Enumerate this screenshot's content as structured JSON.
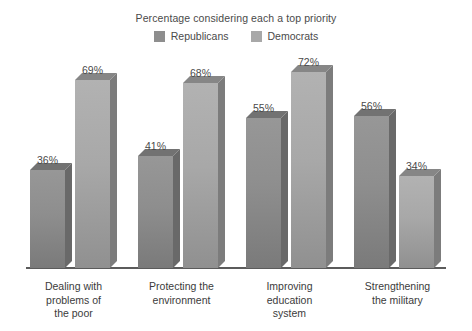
{
  "chart_data": {
    "type": "bar",
    "title": "Percentage considering each a top priority",
    "xlabel": "",
    "ylabel": "",
    "ylim": [
      0,
      100
    ],
    "grid": false,
    "legend_position": "top-center",
    "categories": [
      "Dealing with problems of the poor",
      "Protecting the environment",
      "Improving education system",
      "Strengthening the military"
    ],
    "category_lines": [
      [
        "Dealing with",
        "problems of",
        "the poor"
      ],
      [
        "Protecting the",
        "environment"
      ],
      [
        "Improving",
        "education",
        "system"
      ],
      [
        "Strengthening",
        "the military"
      ]
    ],
    "series": [
      {
        "name": "Republicans",
        "color": "#8e8e8e",
        "values": [
          36,
          41,
          55,
          56
        ],
        "labels": [
          "36%",
          "41%",
          "55%",
          "56%"
        ]
      },
      {
        "name": "Democrats",
        "color": "#a8a8a8",
        "values": [
          69,
          68,
          72,
          34
        ],
        "labels": [
          "69%",
          "68%",
          "72%",
          "34%"
        ]
      }
    ]
  },
  "legend": {
    "items": [
      {
        "label": "Republicans",
        "swatch": "#8e8e8e"
      },
      {
        "label": "Democrats",
        "swatch": "#a8a8a8"
      }
    ]
  },
  "axis": {
    "baseline_color": "#5b5b5b"
  }
}
